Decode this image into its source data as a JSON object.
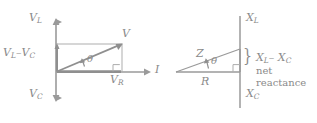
{
  "figure": {
    "stroke_color": "#9a9a9a",
    "text_color": "#8a8a8a",
    "background": "#ffffff"
  },
  "left_diagram": {
    "name": "phasor-diagram",
    "axis_vertical_up_label": "V",
    "axis_vertical_up_sub": "L",
    "axis_vertical_down_label": "V",
    "axis_vertical_down_sub": "C",
    "axis_horizontal_label": "I",
    "resultant_label": "V",
    "component_vertical_label": "V",
    "component_vertical_sub": "L",
    "component_vertical_minus": "–V",
    "component_vertical_sub2": "C",
    "component_horizontal_label": "V",
    "component_horizontal_sub": "R",
    "angle_label": "θ"
  },
  "right_diagram": {
    "name": "impedance-triangle",
    "axis_vertical_up_label": "X",
    "axis_vertical_up_sub": "L",
    "axis_vertical_down_label": "X",
    "axis_vertical_down_sub": "C",
    "hypotenuse_label": "Z",
    "base_label": "R",
    "angle_label": "θ",
    "brace_glyph": "}",
    "brace_label_main": "X",
    "brace_label_main_sub": "L",
    "brace_label_minus": "– X",
    "brace_label_minus_sub": "C",
    "brace_label_line2": "net",
    "brace_label_line3": "reactance"
  }
}
